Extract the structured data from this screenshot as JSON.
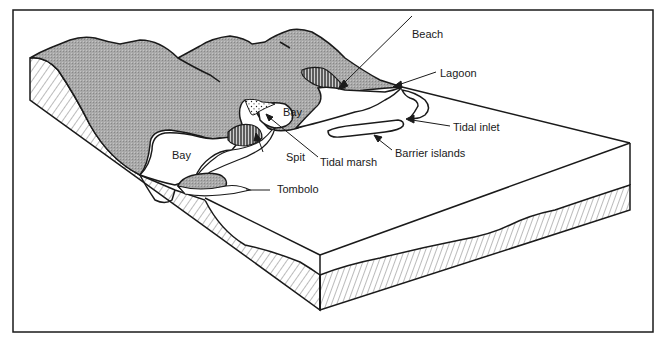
{
  "figure": {
    "colors": {
      "land": "#a9a9a9",
      "ink": "#1a1a1a",
      "water": "#ffffff",
      "paper": "#ffffff"
    },
    "labels": {
      "beach": "Beach",
      "lagoon": "Lagoon",
      "bay_upper": "Bay",
      "bay_lower": "Bay",
      "tidal_inlet": "Tidal inlet",
      "barrier_islands": "Barrier islands",
      "spit": "Spit",
      "tidal_marsh": "Tidal marsh",
      "tombolo": "Tombolo"
    }
  }
}
